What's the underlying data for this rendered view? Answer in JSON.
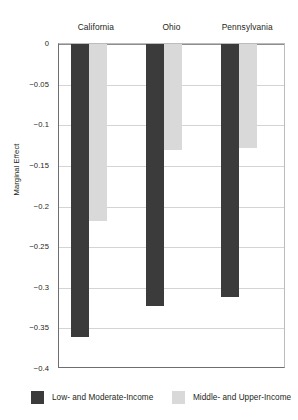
{
  "chart_data": {
    "type": "bar",
    "title": "",
    "subtitle": "",
    "xlabel": "",
    "ylabel": "Marginal Effect",
    "categories": [
      "California",
      "Ohio",
      "Pennsylvania"
    ],
    "series": [
      {
        "name": "Low- and Moderate-Income",
        "color": "#3b3b3b",
        "values": [
          -0.36,
          -0.322,
          -0.311
        ]
      },
      {
        "name": "Middle- and Upper-Income",
        "color": "#d9d9d9",
        "values": [
          -0.218,
          -0.131,
          -0.128
        ]
      }
    ],
    "ylim": [
      -0.4,
      0
    ],
    "yticks": [
      0,
      -0.05,
      -0.1,
      -0.15,
      -0.2,
      -0.25,
      -0.3,
      -0.35,
      -0.4
    ],
    "ytick_labels": [
      "0",
      "−0.05",
      "−0.1",
      "−0.15",
      "−0.2",
      "−0.25",
      "−0.3",
      "−0.35",
      "−0.4"
    ],
    "grid": true,
    "grid_axis": "y",
    "legend_position": "bottom",
    "orientation": "vertical",
    "bar_direction": "downward"
  },
  "axes": {
    "y_title": "Marginal Effect"
  },
  "legend": {
    "items": [
      {
        "label": "Low- and Moderate-Income",
        "color": "#3b3b3b"
      },
      {
        "label": "Middle- and Upper-Income",
        "color": "#d9d9d9"
      }
    ]
  },
  "colors": {
    "dark_series": "#3b3b3b",
    "light_series": "#d9d9d9",
    "gridline": "#d3d4d6",
    "axis": "#6d6e71",
    "text": "#231f20",
    "background": "#ffffff"
  }
}
